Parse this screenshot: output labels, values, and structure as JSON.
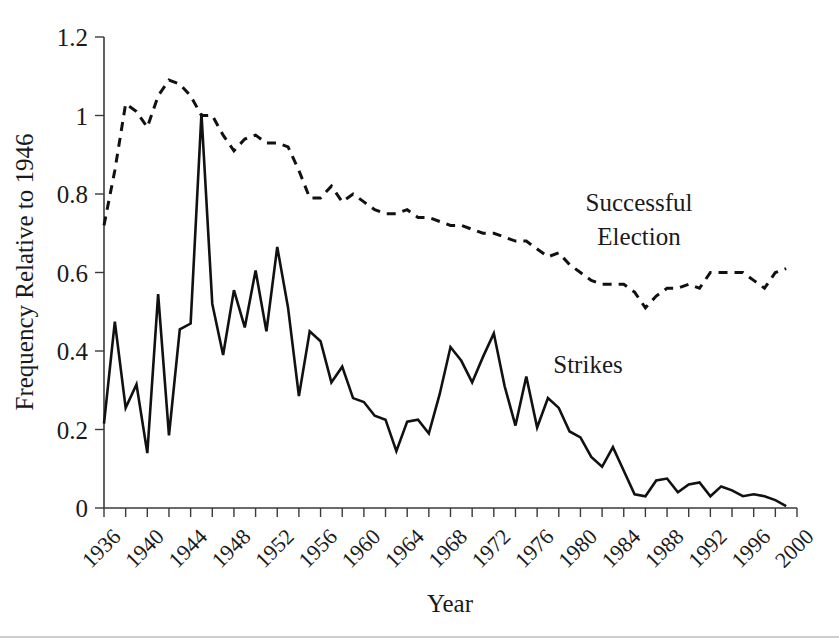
{
  "chart_data": {
    "type": "line",
    "title": "",
    "xlabel": "Year",
    "ylabel": "Frequency Relative to 1946",
    "xlim": [
      1936,
      2000
    ],
    "ylim": [
      0,
      1.2
    ],
    "grid": false,
    "legend_position": "inline-annotation",
    "y_ticks": [
      "0",
      "0.2",
      "0.4",
      "0.6",
      "0.8",
      "1",
      "1.2"
    ],
    "y_tick_values": [
      0,
      0.2,
      0.4,
      0.6,
      0.8,
      1.0,
      1.2
    ],
    "x_ticks": [
      "1936",
      "1940",
      "1944",
      "1948",
      "1952",
      "1956",
      "1960",
      "1964",
      "1968",
      "1972",
      "1976",
      "1980",
      "1984",
      "1988",
      "1992",
      "1996",
      "2000"
    ],
    "x_tick_values": [
      1936,
      1940,
      1944,
      1948,
      1952,
      1956,
      1960,
      1964,
      1968,
      1972,
      1976,
      1980,
      1984,
      1988,
      1992,
      1996,
      2000
    ],
    "x_minor_tick_values": [
      1938,
      1942,
      1946,
      1950,
      1954,
      1958,
      1962,
      1966,
      1970,
      1974,
      1978,
      1982,
      1986,
      1990,
      1994,
      1998
    ],
    "annotations": [
      {
        "text_line1": "Successful",
        "text_line2": "Election",
        "x": 1983,
        "y": 0.8,
        "series": "Successful Election"
      },
      {
        "text_line1": "Strikes",
        "text_line2": "",
        "x": 1976,
        "y": 0.365,
        "series": "Strikes"
      }
    ],
    "series": [
      {
        "name": "Successful Election",
        "style": "dashed",
        "color": "#111111",
        "x": [
          1936,
          1937,
          1938,
          1939,
          1940,
          1941,
          1942,
          1943,
          1944,
          1945,
          1946,
          1947,
          1948,
          1949,
          1950,
          1951,
          1952,
          1953,
          1954,
          1955,
          1956,
          1957,
          1958,
          1959,
          1960,
          1961,
          1962,
          1963,
          1964,
          1965,
          1966,
          1967,
          1968,
          1969,
          1970,
          1971,
          1972,
          1973,
          1974,
          1975,
          1976,
          1977,
          1978,
          1979,
          1980,
          1981,
          1982,
          1983,
          1984,
          1985,
          1986,
          1987,
          1988,
          1989,
          1990,
          1991,
          1992,
          1993,
          1994,
          1995,
          1996,
          1997,
          1998,
          1999
        ],
        "values": [
          0.72,
          0.86,
          1.03,
          1.01,
          0.97,
          1.05,
          1.09,
          1.08,
          1.05,
          1.0,
          1.0,
          0.95,
          0.91,
          0.94,
          0.95,
          0.93,
          0.93,
          0.92,
          0.86,
          0.79,
          0.79,
          0.82,
          0.78,
          0.8,
          0.78,
          0.76,
          0.75,
          0.75,
          0.76,
          0.74,
          0.74,
          0.73,
          0.72,
          0.72,
          0.71,
          0.7,
          0.7,
          0.69,
          0.68,
          0.68,
          0.66,
          0.64,
          0.65,
          0.62,
          0.6,
          0.58,
          0.57,
          0.57,
          0.57,
          0.55,
          0.51,
          0.54,
          0.56,
          0.56,
          0.57,
          0.56,
          0.6,
          0.6,
          0.6,
          0.6,
          0.58,
          0.56,
          0.6,
          0.61
        ]
      },
      {
        "name": "Strikes",
        "style": "solid",
        "color": "#111111",
        "x": [
          1936,
          1937,
          1938,
          1939,
          1940,
          1941,
          1942,
          1943,
          1944,
          1945,
          1946,
          1947,
          1948,
          1949,
          1950,
          1951,
          1952,
          1953,
          1954,
          1955,
          1956,
          1957,
          1958,
          1959,
          1960,
          1961,
          1962,
          1963,
          1964,
          1965,
          1966,
          1967,
          1968,
          1969,
          1970,
          1971,
          1972,
          1973,
          1974,
          1975,
          1976,
          1977,
          1978,
          1979,
          1980,
          1981,
          1982,
          1983,
          1984,
          1985,
          1986,
          1987,
          1988,
          1989,
          1990,
          1991,
          1992,
          1993,
          1994,
          1995,
          1996,
          1997,
          1998,
          1999
        ],
        "values": [
          0.215,
          0.475,
          0.255,
          0.315,
          0.14,
          0.545,
          0.185,
          0.455,
          0.47,
          1.005,
          0.52,
          0.39,
          0.555,
          0.46,
          0.605,
          0.45,
          0.665,
          0.51,
          0.285,
          0.45,
          0.425,
          0.32,
          0.36,
          0.28,
          0.27,
          0.235,
          0.225,
          0.145,
          0.22,
          0.225,
          0.19,
          0.29,
          0.41,
          0.375,
          0.32,
          0.385,
          0.445,
          0.31,
          0.21,
          0.335,
          0.205,
          0.28,
          0.255,
          0.195,
          0.18,
          0.13,
          0.105,
          0.155,
          0.095,
          0.035,
          0.03,
          0.07,
          0.075,
          0.04,
          0.06,
          0.065,
          0.03,
          0.055,
          0.045,
          0.03,
          0.035,
          0.03,
          0.02,
          0.005
        ]
      }
    ]
  },
  "axis": {
    "x_title": "Year",
    "y_title": "Frequency Relative to 1946"
  }
}
